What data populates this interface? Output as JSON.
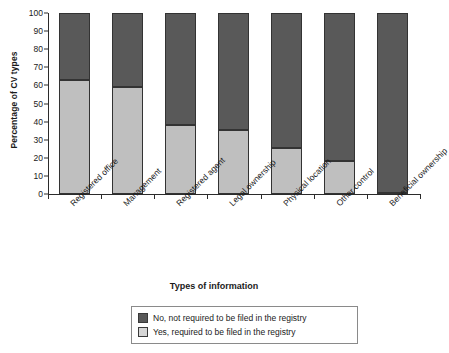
{
  "chart_data": {
    "type": "bar",
    "stacked": true,
    "title": "",
    "xlabel": "Types of information",
    "ylabel": "Percentage of CV types",
    "ylim": [
      0,
      100
    ],
    "yticks": [
      0,
      10,
      20,
      30,
      40,
      50,
      60,
      70,
      80,
      90,
      100
    ],
    "grid": false,
    "legend_position": "bottom",
    "categories": [
      "Registered office",
      "Management",
      "Registered agent",
      "Legal ownership",
      "Physical location",
      "Other control",
      "Beneficial ownership"
    ],
    "series": [
      {
        "name": "No, not required to be filed in the registry",
        "color": "#595959",
        "values": [
          37,
          41,
          62,
          64.5,
          74.5,
          81.5,
          99.5
        ]
      },
      {
        "name": "Yes, required to be filed in the registry",
        "color": "#bfbfbf",
        "values": [
          63,
          59,
          38,
          35.5,
          25.5,
          18.5,
          0.5
        ]
      }
    ]
  },
  "legend": {
    "items": [
      {
        "label": "No, not required to be filed in the registry",
        "swatch": "dark"
      },
      {
        "label": "Yes, required to be filed in the registry",
        "swatch": "light"
      }
    ]
  },
  "colors": {
    "no": "#595959",
    "yes": "#bfbfbf",
    "axis": "#2b2b2b",
    "background": "#ffffff"
  }
}
